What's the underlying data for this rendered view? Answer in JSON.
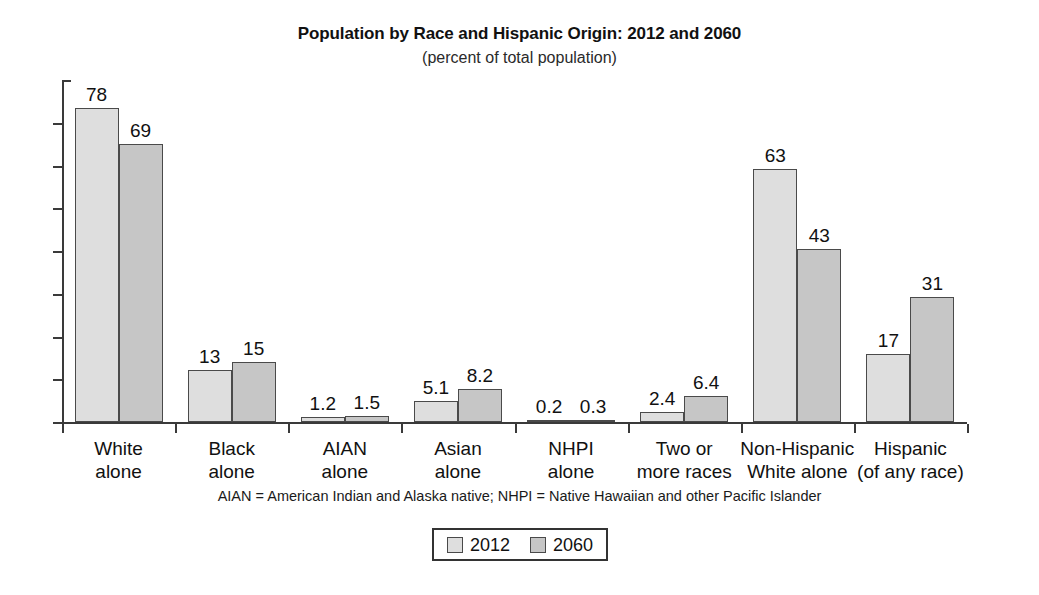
{
  "chart_data": {
    "type": "bar",
    "title": "Population by Race and Hispanic Origin: 2012 and 2060",
    "subtitle": "(percent of total population)",
    "xlabel": "",
    "ylabel": "",
    "ylim": [
      0,
      85
    ],
    "grid": false,
    "legend_position": "bottom-center",
    "categories": [
      "White\nalone",
      "Black\nalone",
      "AIAN\nalone",
      "Asian\nalone",
      "NHPI\nalone",
      "Two or\nmore races",
      "Non-Hispanic\nWhite alone",
      "Hispanic\n(of any race)"
    ],
    "category_lines": [
      [
        "White",
        "alone"
      ],
      [
        "Black",
        "alone"
      ],
      [
        "AIAN",
        "alone"
      ],
      [
        "Asian",
        "alone"
      ],
      [
        "NHPI",
        "alone"
      ],
      [
        "Two or",
        "more races"
      ],
      [
        "Non-Hispanic",
        "White alone"
      ],
      [
        "Hispanic",
        "(of any race)"
      ]
    ],
    "series": [
      {
        "name": "2012",
        "color": "#dedede",
        "values": [
          78,
          13,
          1.2,
          5.1,
          0.2,
          2.4,
          63,
          17
        ],
        "labels": [
          "78",
          "13",
          "1.2",
          "5.1",
          "0.2",
          "2.4",
          "63",
          "17"
        ]
      },
      {
        "name": "2060",
        "color": "#c6c6c6",
        "values": [
          69,
          15,
          1.5,
          8.2,
          0.3,
          6.4,
          43,
          31
        ],
        "labels": [
          "69",
          "15",
          "1.5",
          "8.2",
          "0.3",
          "6.4",
          "43",
          "31"
        ]
      }
    ],
    "y_tick_count": 7,
    "y_axis_labels": []
  },
  "footnote": {
    "text": "AIAN = American Indian and Alaska native; NHPI = Native Hawaiian and other Pacific Islander"
  },
  "legend": {
    "items": [
      {
        "label": "2012",
        "color": "#dedede"
      },
      {
        "label": "2060",
        "color": "#c6c6c6"
      }
    ]
  },
  "colors": {
    "axis": "#3a3a3a",
    "bar_outline": "#4a4a4a",
    "text": "#111111",
    "background": "#ffffff"
  }
}
